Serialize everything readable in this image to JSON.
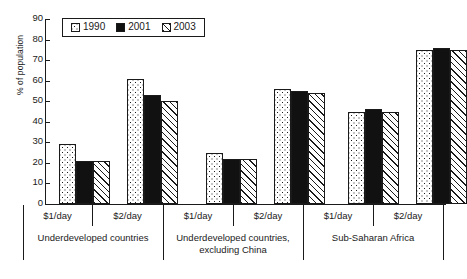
{
  "chart_data": {
    "type": "bar",
    "title": "",
    "xlabel": "",
    "ylabel": "% of population",
    "ylim": [
      0,
      90
    ],
    "yticks": [
      0,
      10,
      20,
      30,
      40,
      50,
      60,
      70,
      80,
      90
    ],
    "grid": false,
    "legend_position": "top-left",
    "categories": [
      "$1/day",
      "$2/day",
      "$1/day",
      "$2/day",
      "$1/day",
      "$2/day"
    ],
    "group_labels": [
      "Underdeveloped countries",
      "Underdeveloped countries, excluding China",
      "Sub-Saharan Africa"
    ],
    "series": [
      {
        "name": "1990",
        "pattern": "dotted",
        "values": [
          29,
          61,
          25,
          56,
          45,
          75
        ]
      },
      {
        "name": "2001",
        "pattern": "solid",
        "values": [
          21,
          53,
          22,
          55,
          46,
          76
        ]
      },
      {
        "name": "2003",
        "pattern": "hatch",
        "values": [
          21,
          50,
          22,
          54,
          45,
          75
        ]
      }
    ]
  },
  "legend": {
    "entries": [
      {
        "label": "1990"
      },
      {
        "label": "2001"
      },
      {
        "label": "2003"
      }
    ]
  },
  "axis": {
    "y_title": "% of population",
    "y_ticks": [
      "90",
      "80",
      "70",
      "60",
      "50",
      "40",
      "30",
      "20",
      "10",
      "0"
    ]
  },
  "x_axis": {
    "sub_labels": [
      "$1/day",
      "$2/day",
      "$1/day",
      "$2/day",
      "$1/day",
      "$2/day"
    ],
    "groups": [
      {
        "line1": "Underdeveloped countries",
        "line2": ""
      },
      {
        "line1": "Underdeveloped countries,",
        "line2": "excluding China"
      },
      {
        "line1": "Sub-Saharan Africa",
        "line2": ""
      }
    ]
  },
  "colors": {
    "ink": "#1a1a1a",
    "solid_fill": "#111111",
    "background": "#ffffff"
  }
}
